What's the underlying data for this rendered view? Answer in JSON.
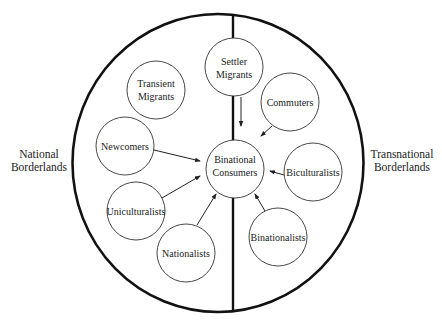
{
  "regions": {
    "left": {
      "line1": "National",
      "line2": "Borderlands"
    },
    "right": {
      "line1": "Transnational",
      "line2": "Borderlands"
    }
  },
  "nodes": [
    {
      "id": "transient",
      "line1": "Transient",
      "line2": "Migrants",
      "cx": 156,
      "cy": 90
    },
    {
      "id": "settler",
      "line1": "Settler",
      "line2": "Migrants",
      "cx": 234,
      "cy": 67
    },
    {
      "id": "commuters",
      "line1": "Commuters",
      "line2": "",
      "cx": 290,
      "cy": 102
    },
    {
      "id": "newcomers",
      "line1": "Newcomers",
      "line2": "",
      "cx": 125,
      "cy": 146
    },
    {
      "id": "consumers",
      "line1": "Binational",
      "line2": "Consumers",
      "cx": 235,
      "cy": 169
    },
    {
      "id": "biculturalists",
      "line1": "Biculturalists",
      "line2": "",
      "cx": 313,
      "cy": 172
    },
    {
      "id": "uniculturalists",
      "line1": "Uniculturalists",
      "line2": "",
      "cx": 136,
      "cy": 211
    },
    {
      "id": "nationalists",
      "line1": "Nationalists",
      "line2": "",
      "cx": 186,
      "cy": 253
    },
    {
      "id": "binationalists",
      "line1": "Binationalists",
      "line2": "",
      "cx": 278,
      "cy": 237
    }
  ],
  "edges": [
    {
      "from": "settler",
      "to": "consumers"
    },
    {
      "from": "commuters",
      "to": "consumers"
    },
    {
      "from": "newcomers",
      "to": "consumers"
    },
    {
      "from": "biculturalists",
      "to": "consumers"
    },
    {
      "from": "uniculturalists",
      "to": "consumers"
    },
    {
      "from": "nationalists",
      "to": "consumers"
    },
    {
      "from": "binationalists",
      "to": "consumers"
    }
  ],
  "colors": {
    "stroke": "#222222",
    "background": "#ffffff"
  }
}
